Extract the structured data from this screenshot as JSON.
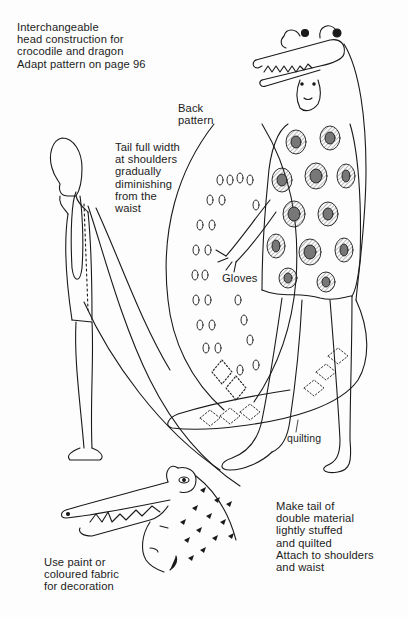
{
  "illustration": {
    "subject": "crocodile costume pattern",
    "figures": [
      "child-outline-side-view",
      "child-in-crocodile-costume",
      "crocodile-head-detail"
    ]
  },
  "labels": {
    "head_note": {
      "lines": [
        "Interchangeable",
        "head construction for",
        "crocodile and dragon",
        "Adapt pattern on page 96"
      ]
    },
    "back_pattern": {
      "lines": [
        "Back",
        "pattern"
      ]
    },
    "tail_width": {
      "lines": [
        "Tail full width",
        "at shoulders",
        "gradually",
        "diminishing",
        "from the",
        "waist"
      ]
    },
    "gloves": {
      "text": "Gloves"
    },
    "quilting": {
      "text": "quilting"
    },
    "tail_material": {
      "lines": [
        "Make tail of",
        "double material",
        "lightly stuffed",
        "and quilted",
        "Attach to shoulders",
        "and waist"
      ]
    },
    "decoration": {
      "lines": [
        "Use paint or",
        "coloured fabric",
        "for decoration"
      ]
    }
  },
  "colors": {
    "ink": "#1a1a1a",
    "paper": "#fdfdfd",
    "hatch": "#8a8a8a"
  }
}
